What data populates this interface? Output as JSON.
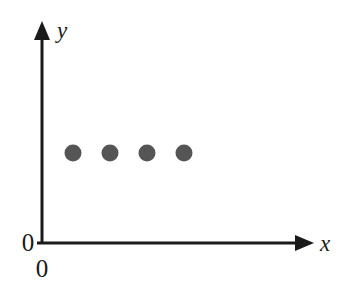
{
  "figure": {
    "background_color": "#ffffff",
    "width": 344,
    "height": 297
  },
  "axes": {
    "color": "#1a1a1a",
    "stroke_width": 3,
    "x_axis": {
      "label": "x",
      "name": "x-axis",
      "start_x": 42,
      "end_x": 313,
      "y": 243,
      "arrow": "arrow-right"
    },
    "y_axis": {
      "label": "y",
      "name": "y-axis",
      "x": 42,
      "start_y": 243,
      "end_y": 22,
      "arrow": "arrow-up"
    },
    "origin_labels": [
      {
        "text": "0",
        "position": "left-of-origin",
        "x": 28,
        "y": 248
      },
      {
        "text": "0",
        "position": "below-origin",
        "x": 42,
        "y": 272
      }
    ]
  },
  "chart_data": {
    "type": "scatter",
    "title": "",
    "subtitle": "",
    "xlabel": "x",
    "ylabel": "y",
    "grid": false,
    "legend": null,
    "marker": {
      "shape": "circle",
      "color": "#555555",
      "radius_px": 8
    },
    "points_px": [
      {
        "cx": 73,
        "cy": 153
      },
      {
        "cx": 110,
        "cy": 153
      },
      {
        "cx": 147,
        "cy": 153
      },
      {
        "cx": 184,
        "cy": 153
      }
    ],
    "x": [
      1,
      2,
      3,
      4
    ],
    "values": [
      1,
      1,
      1,
      1
    ],
    "xlim": [
      0,
      7.3
    ],
    "ylim": [
      0,
      6
    ]
  }
}
